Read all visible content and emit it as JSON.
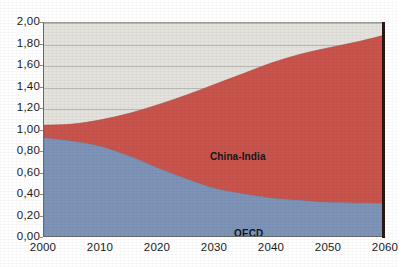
{
  "chart_data": {
    "type": "area",
    "stacked": true,
    "title": "",
    "subtitle": "",
    "xlabel": "",
    "ylabel": "",
    "x": [
      2000,
      2005,
      2010,
      2015,
      2020,
      2025,
      2030,
      2035,
      2040,
      2045,
      2050,
      2055,
      2060
    ],
    "xtick_labels": [
      "2000",
      "2010",
      "2020",
      "2030",
      "2040",
      "2050",
      "2060"
    ],
    "xtick_values": [
      2000,
      2010,
      2020,
      2030,
      2040,
      2050,
      2060
    ],
    "xlim": [
      2000,
      2060
    ],
    "ytick_labels": [
      "0,00",
      "0,20",
      "0,40",
      "0,60",
      "0,80",
      "1,00",
      "1,20",
      "1,40",
      "1,60",
      "1,80",
      "2,00"
    ],
    "ytick_values": [
      0.0,
      0.2,
      0.4,
      0.6,
      0.8,
      1.0,
      1.2,
      1.4,
      1.6,
      1.8,
      2.0
    ],
    "ylim": [
      0.0,
      2.0
    ],
    "grid": true,
    "grid_axis": "y",
    "legend": "inline-labels",
    "series": [
      {
        "name": "OECD",
        "color": "#7d94b8",
        "label_position": "inside-bottom",
        "values": [
          0.93,
          0.9,
          0.85,
          0.76,
          0.65,
          0.55,
          0.46,
          0.41,
          0.37,
          0.35,
          0.33,
          0.325,
          0.32
        ]
      },
      {
        "name": "China-India",
        "color": "#c9544c",
        "label_position": "inside-top",
        "values": [
          0.12,
          0.16,
          0.25,
          0.4,
          0.59,
          0.78,
          0.97,
          1.12,
          1.26,
          1.36,
          1.44,
          1.5,
          1.57
        ]
      }
    ],
    "totals": [
      1.05,
      1.06,
      1.1,
      1.16,
      1.24,
      1.33,
      1.43,
      1.53,
      1.63,
      1.71,
      1.77,
      1.825,
      1.89
    ],
    "plot_background": "#e3e2dc",
    "gridline_color": "#b9b8b1",
    "axis_color": "#6b6b66"
  },
  "labels": {
    "china_india": "China-India",
    "oecd": "OECD"
  }
}
